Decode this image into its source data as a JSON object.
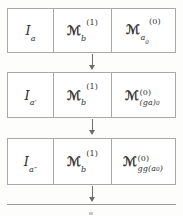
{
  "diagram": {
    "type": "sequence-of-boxed-rows",
    "caption": "",
    "rows": [
      {
        "id": "row-1",
        "cells": [
          {
            "id": "r1c1",
            "symbol": "I",
            "sub": "a",
            "sup": "",
            "plain": "I_a"
          },
          {
            "id": "r1c2",
            "symbol": "M",
            "sub": "b",
            "sup": "(1)",
            "plain": "M_b^(1)"
          },
          {
            "id": "r1c3",
            "symbol": "M",
            "sub": "a0",
            "sup": "(0)",
            "plain": "M_{a_0}^(0)"
          }
        ]
      },
      {
        "id": "row-2",
        "cells": [
          {
            "id": "r2c1",
            "symbol": "I",
            "sub": "a'",
            "sup": "",
            "plain": "I_{a'}"
          },
          {
            "id": "r2c2",
            "symbol": "M",
            "sub": "b",
            "sup": "(1)",
            "plain": "M_b^(1)"
          },
          {
            "id": "r2c3",
            "symbol": "M",
            "sub": "(ga)0",
            "sup": "(0)",
            "plain": "M^(0)_{(ga)_0}"
          }
        ]
      },
      {
        "id": "row-3",
        "cells": [
          {
            "id": "r3c1",
            "symbol": "I",
            "sub": "a''",
            "sup": "",
            "plain": "I_{a''}"
          },
          {
            "id": "r3c2",
            "symbol": "M",
            "sub": "b",
            "sup": "(1)",
            "plain": "M_b^(1)"
          },
          {
            "id": "r3c3",
            "symbol": "M",
            "sub": "gg(a0)",
            "sup": "(0)",
            "plain": "M^(0)_{gg(a_0)}"
          }
        ]
      }
    ],
    "labels": {
      "r1c1_I": "I",
      "r1c1_sub": "a",
      "r1c2_M": "ℳ",
      "r1c2_sub": "b",
      "r1c2_sup": "(1)",
      "r1c3_M": "ℳ",
      "r1c3_sub_a": "a",
      "r1c3_sub_0": "0",
      "r1c3_sup": "(0)",
      "r2c1_I": "I",
      "r2c1_sub": "a′",
      "r2c2_M": "ℳ",
      "r2c2_sub": "b",
      "r2c2_sup": "(1)",
      "r2c3_M": "ℳ",
      "r2c3_sup": "(0)",
      "r2c3_sub_main": "(ga)",
      "r2c3_sub_tail": "0",
      "r3c1_I": "I",
      "r3c1_sub": "a″",
      "r3c2_M": "ℳ",
      "r3c2_sub": "b",
      "r3c2_sup": "(1)",
      "r3c3_M": "ℳ",
      "r3c3_sup": "(0)",
      "r3c3_sub_main": "gg(a",
      "r3c3_sub_tail": "0",
      "r3c3_sub_close": ")"
    },
    "arrows": [
      {
        "id": "arrow-1",
        "direction": "down",
        "from": "row-1",
        "to": "row-2"
      },
      {
        "id": "arrow-2",
        "direction": "down",
        "from": "row-2",
        "to": "row-3"
      },
      {
        "id": "arrow-3",
        "direction": "down",
        "from": "row-3",
        "to": "row-4-cut-off"
      }
    ],
    "colors": {
      "page_background": "#fdfdfc",
      "box_background": "#ffffff",
      "box_border": "#a9a9a6",
      "text": "#333030",
      "arrow": "#6e6b69"
    }
  }
}
